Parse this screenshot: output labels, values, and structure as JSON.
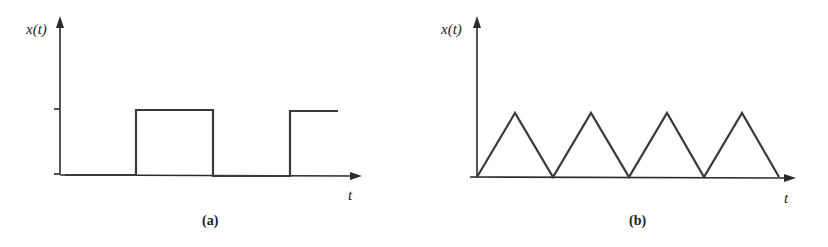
{
  "figures": [
    {
      "id": "a",
      "caption": "(a)",
      "y_label": "x(t)",
      "x_label": "t",
      "waveform": "square",
      "description": "Square wave: low, then high pulse, low, then rising to high"
    },
    {
      "id": "b",
      "caption": "(b)",
      "y_label": "x(t)",
      "x_label": "t",
      "waveform": "triangle",
      "description": "Triangle wave with four peaks starting from zero"
    }
  ],
  "colors": {
    "line": "#3a3a3a",
    "axis": "#2b2b2b",
    "background": "#ffffff"
  }
}
